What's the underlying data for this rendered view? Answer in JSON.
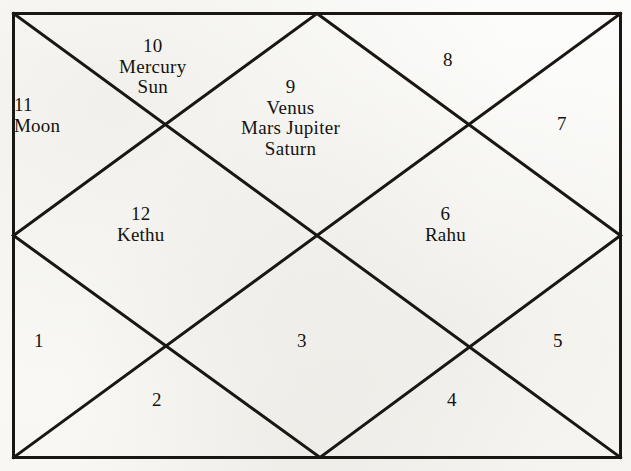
{
  "chart": {
    "type": "north-indian-vedic-birth-chart",
    "title": "",
    "background_color": "#fdfdfb",
    "line_color": "#1a1713",
    "text_color": "#15130f",
    "frame": {
      "x": 13,
      "y": 13,
      "width": 607,
      "height": 444
    },
    "houses": [
      {
        "number": "1",
        "planets": []
      },
      {
        "number": "2",
        "planets": []
      },
      {
        "number": "3",
        "planets": []
      },
      {
        "number": "4",
        "planets": []
      },
      {
        "number": "5",
        "planets": []
      },
      {
        "number": "6",
        "planets": [
          "Rahu"
        ]
      },
      {
        "number": "7",
        "planets": []
      },
      {
        "number": "8",
        "planets": []
      },
      {
        "number": "9",
        "planets": [
          "Venus",
          "Mars  Jupiter",
          "Saturn"
        ]
      },
      {
        "number": "10",
        "planets": [
          "Mercury",
          "Sun"
        ]
      },
      {
        "number": "11",
        "planets": [
          "Moon"
        ]
      },
      {
        "number": "12",
        "planets": [
          "Kethu"
        ]
      }
    ]
  }
}
